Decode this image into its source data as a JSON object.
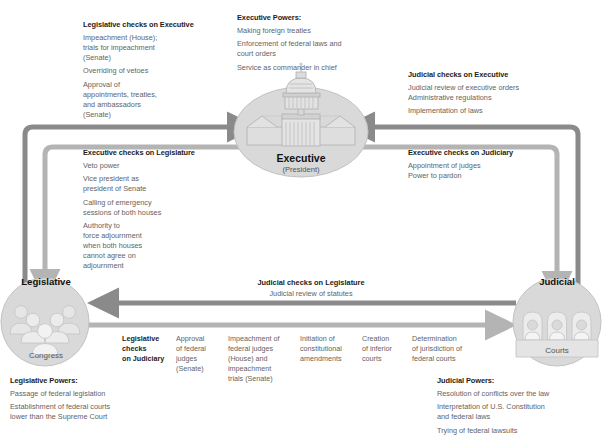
{
  "diagram": {
    "accent_dark": "#8a8a8a",
    "accent_light": "#b4b4b4",
    "node_fill": "#d8d8d8"
  },
  "nodes": {
    "executive": {
      "label": "Executive",
      "sublabel": "(President)",
      "icon": "capitol-building-icon"
    },
    "legislative": {
      "label": "Legislative",
      "sublabel": "Congress",
      "icon": "group-of-people-icon"
    },
    "judicial": {
      "label": "Judicial",
      "sublabel": "Courts",
      "icon": "judges-bench-icon"
    }
  },
  "blocks": {
    "legislative_checks_on_executive": {
      "heading": "Legislative checks on Executive",
      "items": [
        "Impeachment (House);\ntrials for impeachment\n(Senate)",
        "Overriding of vetoes",
        "Approval of\nappointments, treaties,\nand ambassadors\n(Senate)"
      ]
    },
    "executive_powers": {
      "heading": "Executive Powers:",
      "items": [
        "Making foreign treaties",
        "Enforcement of federal laws and\ncourt orders",
        "Service as commander in chief"
      ]
    },
    "judicial_checks_on_executive": {
      "heading": "Judicial checks on Executive",
      "items": [
        "Judicial review of executive orders\nAdministrative regulations",
        "Implementation of laws"
      ]
    },
    "executive_checks_on_legislature": {
      "heading": "Executive checks on Legislature",
      "items": [
        "Veto power",
        "Vice president as\npresident of Senate",
        "Calling of emergency\nsessions of both houses",
        "Authority to\nforce adjournment\nwhen both houses\ncannot agree on\nadjournment"
      ]
    },
    "executive_checks_on_judiciary": {
      "heading": "Executive checks on Judiciary",
      "items": [
        "Appointment of judges\nPower to pardon"
      ]
    },
    "judicial_checks_on_legislature": {
      "heading": "Judicial checks on Legislature",
      "subtext": "Judicial review of statutes"
    },
    "legislative_checks_on_judiciary": {
      "heading": "Legislative\nchecks\non Judiciary",
      "columns": [
        "Approval\nof federal\njudges\n(Senate)",
        "Impeachment of\nfederal judges\n(House) and\nimpeachment\ntrials (Senate)",
        "Initiation of\nconstitutional\namendments",
        "Creation\nof inferior\ncourts",
        "Determination\nof jurisdiction of\nfederal courts"
      ]
    },
    "legislative_powers": {
      "heading": "Legislative Powers:",
      "items": [
        "Passage of federal legislation",
        "Establishment of federal courts\nlower than the Supreme Court"
      ]
    },
    "judicial_powers": {
      "heading": "Judicial Powers:",
      "items": [
        "Resolution of conflicts over the law",
        "Interpretation of U.S. Constitution\nand federal laws",
        "Trying of federal lawsuits"
      ]
    }
  }
}
